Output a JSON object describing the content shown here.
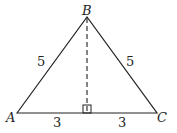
{
  "diagram": {
    "type": "isosceles-triangle",
    "vertices": {
      "A": "A",
      "B": "B",
      "C": "C"
    },
    "side_labels": {
      "AB": "5",
      "BC": "5",
      "A_foot": "3",
      "foot_C": "3"
    },
    "altitude": "dashed from B perpendicular to AC",
    "right_angle_marker": true
  }
}
